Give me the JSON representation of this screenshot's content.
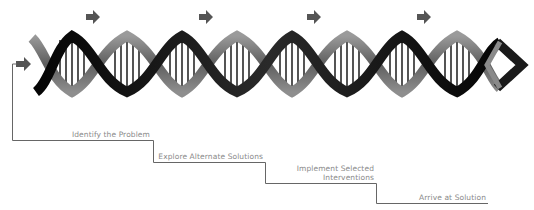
{
  "diagram": {
    "type": "dna-helix-process-staircase",
    "colors": {
      "strand_dark": "#111111",
      "strand_mid": "#6e6e6e",
      "strand_light": "#a9a9a9",
      "rung": "#2a2a2a",
      "arrow": "#555555",
      "staircase_line": "#666666",
      "label_text": "#8a8a8a"
    },
    "arrows": {
      "top": [
        {
          "x": 91,
          "y": 17,
          "icon": "right-arrow-icon"
        },
        {
          "x": 204,
          "y": 17,
          "icon": "right-arrow-icon"
        },
        {
          "x": 312,
          "y": 17,
          "icon": "right-arrow-icon"
        },
        {
          "x": 422,
          "y": 17,
          "icon": "right-arrow-icon"
        }
      ],
      "entry": {
        "x": 17,
        "y": 64,
        "icon": "right-arrow-icon"
      }
    },
    "steps": [
      {
        "label": "Identify the Problem"
      },
      {
        "label": "Explore Alternate Solutions"
      },
      {
        "label_line1": "Implement Selected",
        "label_line2": "Interventions"
      },
      {
        "label": "Arrive at Solution"
      }
    ]
  }
}
